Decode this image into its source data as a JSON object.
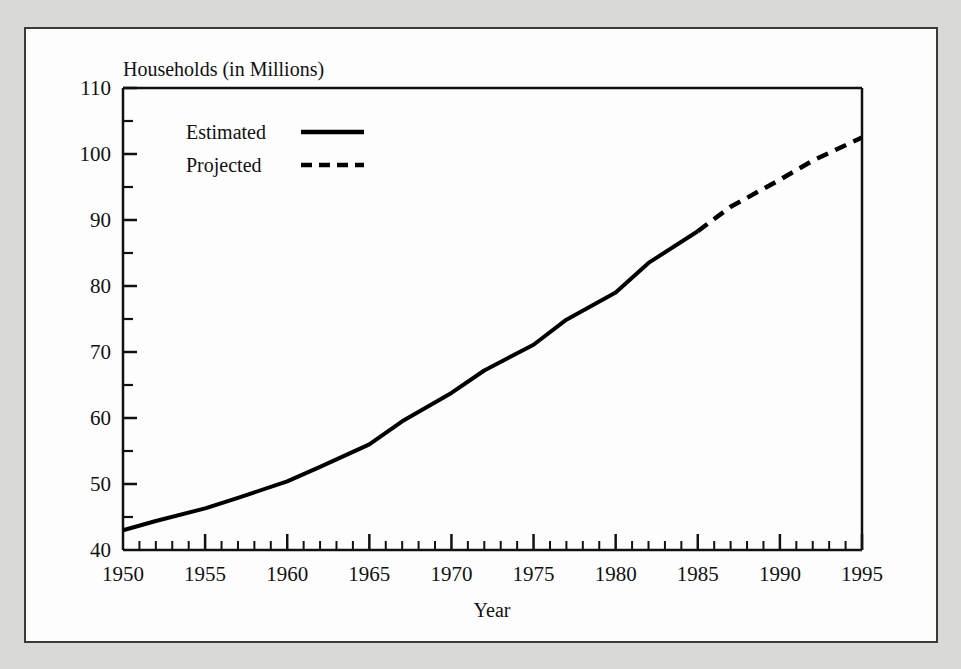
{
  "figure": {
    "background_color": "#d9d9d7",
    "card_color": "#fdfdfd",
    "border_color": "#3a3a3a",
    "line_color": "#000000"
  },
  "chart_data": {
    "type": "line",
    "title": "Households (in Millions)",
    "xlabel": "Year",
    "ylabel": "",
    "xlim": [
      1950,
      1995
    ],
    "ylim": [
      40,
      110
    ],
    "grid": false,
    "legend_position": "inside-top-left",
    "y_ticks_major": [
      40,
      50,
      60,
      70,
      80,
      90,
      100,
      110
    ],
    "y_ticks_minor": [
      45,
      55,
      65,
      75,
      85,
      95,
      105
    ],
    "x_ticks_major": [
      1950,
      1955,
      1960,
      1965,
      1970,
      1975,
      1980,
      1985,
      1990,
      1995
    ],
    "x_tick_labels": [
      "1950",
      "1955",
      "1960",
      "1965",
      "1970",
      "1975",
      "1980",
      "1985",
      "1990",
      "1995"
    ],
    "y_tick_labels": [
      "40",
      "50",
      "60",
      "70",
      "80",
      "90",
      "100",
      "110"
    ],
    "x_minor_interval": 1,
    "series": [
      {
        "name": "Estimated",
        "style": "solid",
        "x": [
          1950,
          1952,
          1955,
          1957,
          1960,
          1962,
          1965,
          1967,
          1970,
          1972,
          1975,
          1977,
          1980,
          1982,
          1985
        ],
        "values": [
          43.0,
          44.4,
          46.3,
          47.9,
          50.4,
          52.6,
          56.0,
          59.5,
          63.8,
          67.2,
          71.1,
          74.9,
          79.0,
          83.5,
          88.3
        ]
      },
      {
        "name": "Projected",
        "style": "dashed",
        "x": [
          1985,
          1987,
          1990,
          1992,
          1995
        ],
        "values": [
          88.3,
          92.0,
          96.1,
          99.0,
          102.5
        ]
      }
    ]
  },
  "legend": {
    "entries": [
      {
        "label": "Estimated",
        "style": "solid"
      },
      {
        "label": "Projected",
        "style": "dashed"
      }
    ]
  }
}
